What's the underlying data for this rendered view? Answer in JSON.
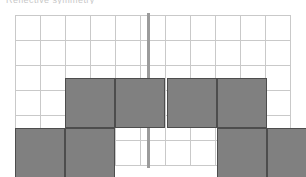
{
  "caption": {
    "text": "Reflective symmetry"
  },
  "canvas": {
    "width": 306,
    "height": 177,
    "background": "#ffffff"
  },
  "grid": {
    "origin_x": 15,
    "origin_y": 15,
    "cell_size": 25,
    "columns": 11,
    "rows": 6,
    "line_color": "#c9c9c9",
    "visible": true
  },
  "mirror_line": {
    "label": "line of symmetry",
    "orientation": "vertical",
    "x": 147,
    "color": "#9b9b9b",
    "thickness": 3
  },
  "style": {
    "shape_fill": "#808080",
    "shape_border": "#4d4d4d",
    "shape_cell_size": 50
  },
  "shapes": [
    {
      "name": "left-shape",
      "type": "S-tetromino",
      "cell_count": 4,
      "cells": [
        {
          "name": "left-cell-top-left",
          "col": 3,
          "row": 3,
          "x": 65,
          "y": 78
        },
        {
          "name": "left-cell-top-right",
          "col": 4,
          "row": 3,
          "x": 115,
          "y": 78
        },
        {
          "name": "left-cell-bottom-left",
          "col": 2,
          "row": 4,
          "x": 15,
          "y": 128
        },
        {
          "name": "left-cell-bottom-right",
          "col": 3,
          "row": 4,
          "x": 65,
          "y": 128
        }
      ]
    },
    {
      "name": "right-shape",
      "type": "Z-tetromino",
      "cell_count": 4,
      "cells": [
        {
          "name": "right-cell-top-left",
          "col": 7,
          "row": 3,
          "x": 167,
          "y": 78
        },
        {
          "name": "right-cell-top-right",
          "col": 8,
          "row": 3,
          "x": 217,
          "y": 78
        },
        {
          "name": "right-cell-bottom-left",
          "col": 8,
          "row": 4,
          "x": 217,
          "y": 128
        },
        {
          "name": "right-cell-bottom-right",
          "col": 9,
          "row": 4,
          "x": 267,
          "y": 128
        }
      ]
    }
  ]
}
